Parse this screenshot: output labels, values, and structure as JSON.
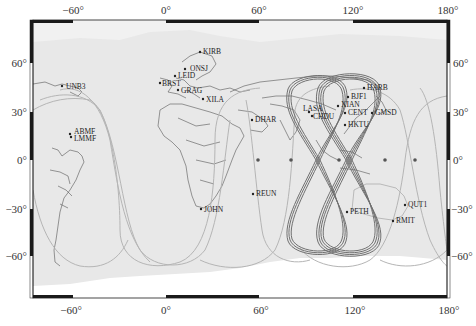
{
  "map": {
    "projection": "equirectangular",
    "extent": {
      "lon_min": -86,
      "lon_max": 180,
      "lat_min": -86,
      "lat_max": 87
    },
    "colors": {
      "land": "#ffffff",
      "ocean": "#e8e8e8",
      "frame": "#1a1a1a",
      "border": "#555555",
      "track_igso": "#6e6e6e",
      "track_meo": "#b0b0b0",
      "station": "#222222",
      "geo_sat": "#555555"
    },
    "x_ticks": [
      {
        "lon": -60,
        "label": "−60°"
      },
      {
        "lon": 0,
        "label": "0°"
      },
      {
        "lon": 60,
        "label": "60°"
      },
      {
        "lon": 120,
        "label": "120°"
      },
      {
        "lon": 180,
        "label": "180°"
      }
    ],
    "y_ticks": [
      {
        "lat": 60,
        "label": "60°"
      },
      {
        "lat": 30,
        "label": "30°"
      },
      {
        "lat": 0,
        "label": "0°"
      },
      {
        "lat": -30,
        "label": "−30°"
      },
      {
        "lat": -60,
        "label": "−60°"
      }
    ],
    "stations": [
      {
        "name": "KIRB",
        "lon": 25,
        "lat": 67
      },
      {
        "name": "ONSJ",
        "lon": 12,
        "lat": 57
      },
      {
        "name": "LEID",
        "lon": 5,
        "lat": 52
      },
      {
        "name": "BRST",
        "lon": -4,
        "lat": 48
      },
      {
        "name": "GRAG",
        "lon": 6,
        "lat": 44
      },
      {
        "name": "XILA",
        "lon": 24,
        "lat": 38
      },
      {
        "name": "UNB3",
        "lon": -66,
        "lat": 46
      },
      {
        "name": "ABMF",
        "lon": -61,
        "lat": 16
      },
      {
        "name": "LMMF",
        "lon": -61,
        "lat": 14
      },
      {
        "name": "DHAR",
        "lon": 52,
        "lat": 25
      },
      {
        "name": "LASA",
        "lon": 91,
        "lat": 29
      },
      {
        "name": "CHDU",
        "lon": 104,
        "lat": 28
      },
      {
        "name": "XIAN",
        "lon": 109,
        "lat": 34
      },
      {
        "name": "BJF1",
        "lon": 116,
        "lat": 40
      },
      {
        "name": "HARB",
        "lon": 127,
        "lat": 46
      },
      {
        "name": "CENT",
        "lon": 114,
        "lat": 30
      },
      {
        "name": "GMSD",
        "lon": 131,
        "lat": 30
      },
      {
        "name": "HKTU",
        "lon": 114,
        "lat": 22
      },
      {
        "name": "REUN",
        "lon": 55,
        "lat": -21
      },
      {
        "name": "JOHN",
        "lon": 28,
        "lat": -31
      },
      {
        "name": "PETH",
        "lon": 116,
        "lat": -32
      },
      {
        "name": "QUT1",
        "lon": 153,
        "lat": -28
      },
      {
        "name": "RMIT",
        "lon": 145,
        "lat": -38
      }
    ],
    "geo_satellites": [
      {
        "lon": 59,
        "lat": 0
      },
      {
        "lon": 80,
        "lat": 0
      },
      {
        "lon": 111,
        "lat": 0
      },
      {
        "lon": 140,
        "lat": 0
      },
      {
        "lon": 160,
        "lat": 0
      }
    ],
    "igso_tracks": [
      {
        "center_lon": 95,
        "lat_amp": 55,
        "lon_amp": 14
      },
      {
        "center_lon": 118,
        "lat_amp": 55,
        "lon_amp": 14
      }
    ]
  }
}
